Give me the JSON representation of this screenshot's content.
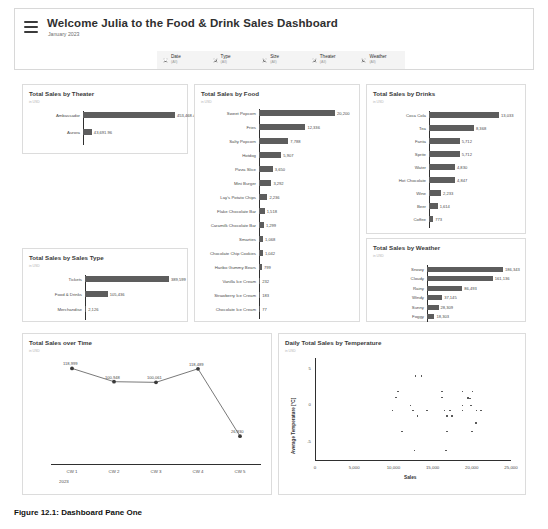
{
  "header": {
    "menu_icon": "hamburger-menu-icon",
    "title": "Welcome Julia to the Food & Drink Sales Dashboard",
    "subtitle": "January 2023",
    "filters": [
      {
        "icon": "gear-icon",
        "label": "Date",
        "value": "(All)"
      },
      {
        "icon": "gear-icon",
        "label": "Type",
        "value": "(All)"
      },
      {
        "icon": "gear-icon",
        "label": "Size",
        "value": "(All)"
      },
      {
        "icon": "gear-icon",
        "label": "Theater",
        "value": "(All)"
      },
      {
        "icon": "gear-icon",
        "label": "Weather",
        "value": "(All)"
      }
    ]
  },
  "caption": "Figure 12.1: Dashboard Pane One",
  "panels": {
    "theater": {
      "title": "Total Sales by Theater",
      "sub": "in USD"
    },
    "food": {
      "title": "Total Sales by Food",
      "sub": "in USD"
    },
    "drinks": {
      "title": "Total Sales by Drinks",
      "sub": "in USD"
    },
    "salestype": {
      "title": "Total Sales by Sales Type",
      "sub": "in USD"
    },
    "weather": {
      "title": "Total Sales by Weather",
      "sub": "in USD"
    },
    "overtime": {
      "title": "Total Sales over Time",
      "sub": "in USD"
    },
    "scatter": {
      "title": "Daily Total Sales by Temperature",
      "sub": "in USD"
    }
  },
  "chart_data": [
    {
      "id": "theater",
      "type": "bar",
      "orientation": "horizontal",
      "title": "Total Sales by Theater",
      "xlabel": "",
      "ylabel": "",
      "categories": [
        "Ambassador",
        "Aurora"
      ],
      "values": [
        453468.43,
        43691.96
      ],
      "value_labels": [
        "453,468.43",
        "43,691.96"
      ],
      "xlim": [
        0,
        453468.43
      ]
    },
    {
      "id": "food",
      "type": "bar",
      "orientation": "horizontal",
      "title": "Total Sales by Food",
      "xlabel": "",
      "ylabel": "",
      "categories": [
        "Sweet Popcorn",
        "Fries",
        "Salty Popcorn",
        "Hotdog",
        "Pizza Slice",
        "Mini Burger",
        "Lay's Potato Chips",
        "Flake Chocolate Bar",
        "Caramilk Chocolate Bar",
        "Smarties",
        "Chocolate Chip Cookies",
        "Haribo Gummy Bears",
        "Vanilla Ice Cream",
        "Strawberry Ice Cream",
        "Chocolate Ice Cream"
      ],
      "values": [
        20200,
        12336,
        7788,
        5907,
        3650,
        3292,
        2236,
        1518,
        1299,
        1068,
        1042,
        799,
        232,
        183,
        77
      ],
      "value_labels": [
        "20,200",
        "12,336",
        "7,788",
        "5,907",
        "3,650",
        "3,292",
        "2,236",
        "1,518",
        "1,299",
        "1,068",
        "1,042",
        "799",
        "232",
        "183",
        "77"
      ],
      "xlim": [
        0,
        20200
      ]
    },
    {
      "id": "drinks",
      "type": "bar",
      "orientation": "horizontal",
      "title": "Total Sales by Drinks",
      "xlabel": "",
      "ylabel": "",
      "categories": [
        "Coca Cola",
        "Tea",
        "Fanta",
        "Sprite",
        "Water",
        "Hot Chocolate",
        "Wine",
        "Beer",
        "Coffee"
      ],
      "values": [
        13033,
        8368,
        5712,
        5712,
        4830,
        4847,
        2233,
        1614,
        773
      ],
      "value_labels": [
        "13,033",
        "8,368",
        "5,712",
        "5,712",
        "4,830",
        "4,847",
        "2,233",
        "1,614",
        "773"
      ],
      "xlim": [
        0,
        13033
      ]
    },
    {
      "id": "salestype",
      "type": "bar",
      "orientation": "horizontal",
      "title": "Total Sales by Sales Type",
      "xlabel": "",
      "ylabel": "",
      "categories": [
        "Tickets",
        "Food & Drinks",
        "Merchandise"
      ],
      "values": [
        389599,
        105436,
        2126
      ],
      "value_labels": [
        "389,599",
        "105,436",
        "2,126"
      ],
      "xlim": [
        0,
        389599
      ]
    },
    {
      "id": "weather",
      "type": "bar",
      "orientation": "horizontal",
      "title": "Total Sales by Weather",
      "xlabel": "",
      "ylabel": "",
      "categories": [
        "Snowy",
        "Cloudy",
        "Rainy",
        "Windy",
        "Sunny",
        "Foggy"
      ],
      "values": [
        186343,
        161136,
        86493,
        37145,
        28309,
        18303
      ],
      "value_labels": [
        "186,343",
        "161,136",
        "86,493",
        "37,145",
        "28,309",
        "18,303"
      ],
      "xlim": [
        0,
        186343
      ]
    },
    {
      "id": "overtime",
      "type": "line",
      "title": "Total Sales over Time",
      "xlabel": "",
      "ylabel": "",
      "categories": [
        "CW 1",
        "CW 2",
        "CW 3",
        "CW 4",
        "CW 5"
      ],
      "year_label": "2023",
      "values": [
        118999,
        100948,
        100061,
        118489,
        26930
      ],
      "value_labels": [
        "118,999",
        "100,948",
        "100,061",
        "118,489",
        "26,930"
      ],
      "ylim": [
        0,
        125000
      ]
    },
    {
      "id": "scatter",
      "type": "scatter",
      "title": "Daily Total Sales by Temperature",
      "xlabel": "Sales",
      "ylabel": "Average Temperature [°C]",
      "xticks": [
        "0",
        "5,000",
        "10,000",
        "15,000",
        "20,000",
        "25,000"
      ],
      "xtick_values": [
        0,
        5000,
        10000,
        15000,
        20000,
        25000
      ],
      "yticks": [
        "5",
        "0",
        "-5"
      ],
      "ytick_values": [
        5,
        0,
        -5
      ],
      "xlim": [
        0,
        25000
      ],
      "ylim": [
        -7.5,
        6.5
      ],
      "points": [
        [
          12800,
          4.0
        ],
        [
          13600,
          4.0
        ],
        [
          10600,
          1.9
        ],
        [
          16200,
          1.9
        ],
        [
          18800,
          1.9
        ],
        [
          20100,
          1.9
        ],
        [
          10300,
          1.1
        ],
        [
          16200,
          1.1
        ],
        [
          19500,
          1.0
        ],
        [
          19800,
          0.95
        ],
        [
          12200,
          0.0
        ],
        [
          18800,
          0.0
        ],
        [
          19900,
          0.0
        ],
        [
          9900,
          -0.7
        ],
        [
          12500,
          -0.7
        ],
        [
          14300,
          -0.7
        ],
        [
          16500,
          -0.7
        ],
        [
          17200,
          -0.7
        ],
        [
          18800,
          -0.7
        ],
        [
          20600,
          -0.7
        ],
        [
          21200,
          -0.7
        ],
        [
          13100,
          -1.5
        ],
        [
          16800,
          -1.5
        ],
        [
          17500,
          -1.5
        ],
        [
          20500,
          -2.4
        ],
        [
          11100,
          -3.6
        ],
        [
          16800,
          -3.6
        ],
        [
          20000,
          -3.6
        ],
        [
          12700,
          -6.2
        ],
        [
          16700,
          -6.2
        ]
      ]
    }
  ]
}
